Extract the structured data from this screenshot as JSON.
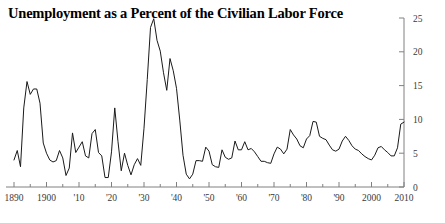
{
  "figure": {
    "title": "Unemployment as a Percent of the Civilian Labor Force",
    "background_color": "#ffffff",
    "line_color": "#1a1a1a",
    "axis_color": "#808080",
    "text_color": "#3a3a3a"
  },
  "chart_data": {
    "type": "line",
    "title": "Unemployment as a Percent of the Civilian Labor Force",
    "xlabel": "",
    "ylabel": "",
    "xlim": [
      1890,
      2010
    ],
    "ylim": [
      0,
      25
    ],
    "grid": false,
    "legend": null,
    "y_axis_position": "right",
    "y_ticks": [
      0,
      5,
      10,
      15,
      20,
      25
    ],
    "y_tick_labels": [
      "0",
      "5",
      "10",
      "15",
      "20",
      "25"
    ],
    "x_ticks": [
      1890,
      1895,
      1900,
      1905,
      1910,
      1915,
      1920,
      1925,
      1930,
      1935,
      1940,
      1945,
      1950,
      1955,
      1960,
      1965,
      1970,
      1975,
      1980,
      1985,
      1990,
      1995,
      2000,
      2005,
      2010
    ],
    "x_tick_labels": [
      {
        "value": 1890,
        "label": "1890"
      },
      {
        "value": 1900,
        "label": "1900"
      },
      {
        "value": 1910,
        "label": "'10"
      },
      {
        "value": 1920,
        "label": "'20"
      },
      {
        "value": 1930,
        "label": "'30"
      },
      {
        "value": 1940,
        "label": "'40"
      },
      {
        "value": 1950,
        "label": "'50"
      },
      {
        "value": 1960,
        "label": "'60"
      },
      {
        "value": 1970,
        "label": "'70"
      },
      {
        "value": 1980,
        "label": "'80"
      },
      {
        "value": 1990,
        "label": "'90"
      },
      {
        "value": 2000,
        "label": "2000"
      },
      {
        "value": 2010,
        "label": "2010"
      }
    ],
    "series": [
      {
        "name": "Unemployment rate",
        "x": [
          1890,
          1891,
          1892,
          1893,
          1894,
          1895,
          1896,
          1897,
          1898,
          1899,
          1900,
          1901,
          1902,
          1903,
          1904,
          1905,
          1906,
          1907,
          1908,
          1909,
          1910,
          1911,
          1912,
          1913,
          1914,
          1915,
          1916,
          1917,
          1918,
          1919,
          1920,
          1921,
          1922,
          1923,
          1924,
          1925,
          1926,
          1927,
          1928,
          1929,
          1930,
          1931,
          1932,
          1933,
          1934,
          1935,
          1936,
          1937,
          1938,
          1939,
          1940,
          1941,
          1942,
          1943,
          1944,
          1945,
          1946,
          1947,
          1948,
          1949,
          1950,
          1951,
          1952,
          1953,
          1954,
          1955,
          1956,
          1957,
          1958,
          1959,
          1960,
          1961,
          1962,
          1963,
          1964,
          1965,
          1966,
          1967,
          1968,
          1969,
          1970,
          1971,
          1972,
          1973,
          1974,
          1975,
          1976,
          1977,
          1978,
          1979,
          1980,
          1981,
          1982,
          1983,
          1984,
          1985,
          1986,
          1987,
          1988,
          1989,
          1990,
          1991,
          1992,
          1993,
          1994,
          1995,
          1996,
          1997,
          1998,
          1999,
          2000,
          2001,
          2002,
          2003,
          2004,
          2005,
          2006,
          2007,
          2008,
          2009,
          2010
        ],
        "values": [
          4.0,
          5.4,
          3.0,
          11.7,
          15.6,
          13.7,
          14.5,
          14.5,
          12.4,
          6.5,
          5.0,
          4.0,
          3.7,
          3.9,
          5.4,
          4.3,
          1.7,
          2.8,
          8.0,
          5.1,
          5.9,
          6.7,
          4.6,
          4.3,
          7.9,
          8.5,
          5.1,
          4.6,
          1.4,
          1.4,
          5.2,
          11.7,
          6.7,
          2.4,
          5.0,
          3.2,
          1.8,
          3.3,
          4.2,
          3.2,
          8.7,
          15.9,
          23.6,
          24.9,
          21.7,
          20.1,
          16.9,
          14.3,
          19.0,
          17.2,
          14.6,
          9.9,
          4.7,
          1.9,
          1.2,
          1.9,
          3.9,
          3.9,
          3.8,
          5.9,
          5.3,
          3.3,
          3.0,
          2.9,
          5.5,
          4.4,
          4.1,
          4.3,
          6.8,
          5.5,
          5.5,
          6.7,
          5.5,
          5.7,
          5.2,
          4.5,
          3.8,
          3.8,
          3.6,
          3.5,
          4.9,
          5.9,
          5.6,
          4.9,
          5.6,
          8.5,
          7.7,
          7.1,
          6.1,
          5.8,
          7.1,
          7.6,
          9.7,
          9.6,
          7.5,
          7.2,
          7.0,
          6.2,
          5.5,
          5.3,
          5.6,
          6.8,
          7.5,
          6.9,
          6.1,
          5.6,
          5.4,
          4.9,
          4.5,
          4.2,
          4.0,
          4.7,
          5.8,
          6.0,
          5.5,
          5.1,
          4.6,
          4.6,
          5.8,
          9.3,
          9.6
        ]
      }
    ],
    "annotations": [
      {
        "label": "1890s depression peak",
        "year": 1897,
        "value": 14.5
      },
      {
        "label": "Great Depression peak",
        "year": 1933,
        "value": 24.9
      },
      {
        "label": "WWII trough",
        "year": 1944,
        "value": 1.2
      },
      {
        "label": "Early 1980s recession peak",
        "year": 1982,
        "value": 9.7
      },
      {
        "label": "Great Recession peak",
        "year": 2010,
        "value": 9.6
      }
    ]
  }
}
